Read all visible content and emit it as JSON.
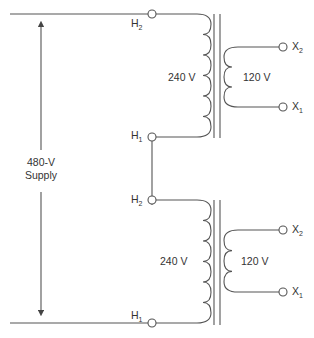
{
  "diagram": {
    "supply": {
      "line1": "480-V",
      "line2": "Supply"
    },
    "transformers": [
      {
        "primary_label": "240 V",
        "secondary_label": "120 V",
        "h_top": {
          "letter": "H",
          "sub": "2"
        },
        "h_bottom": {
          "letter": "H",
          "sub": "1"
        },
        "x_top": {
          "letter": "X",
          "sub": "2"
        },
        "x_bottom": {
          "letter": "X",
          "sub": "1"
        }
      },
      {
        "primary_label": "240 V",
        "secondary_label": "120 V",
        "h_top": {
          "letter": "H",
          "sub": "2"
        },
        "h_bottom": {
          "letter": "H",
          "sub": "1"
        },
        "x_top": {
          "letter": "X",
          "sub": "2"
        },
        "x_bottom": {
          "letter": "X",
          "sub": "1"
        }
      }
    ]
  }
}
